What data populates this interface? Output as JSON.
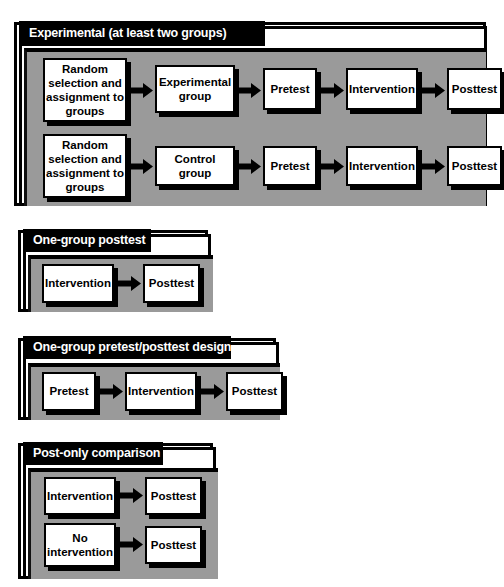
{
  "diagram": {
    "panel_color": "#9a9a9a",
    "title_bar_color": "#000000",
    "box_color": "#ffffff",
    "arrow_color": "#000000"
  },
  "sections": [
    {
      "id": "experimental",
      "title": "Experimental (at least two groups)",
      "rows": [
        {
          "id": "experimental-row-1",
          "nodes": [
            "Random selection and assignment to groups",
            "Experimental group",
            "Pretest",
            "Intervention",
            "Posttest"
          ]
        },
        {
          "id": "experimental-row-2",
          "nodes": [
            "Random selection and assignment to groups",
            "Control group",
            "Pretest",
            "Intervention",
            "Posttest"
          ]
        }
      ]
    },
    {
      "id": "one-group-posttest",
      "title": "One-group posttest",
      "rows": [
        {
          "id": "one-group-posttest-row-1",
          "nodes": [
            "Intervention",
            "Posttest"
          ]
        }
      ]
    },
    {
      "id": "one-group-pretest-posttest",
      "title": "One-group pretest/posttest design",
      "rows": [
        {
          "id": "one-group-pretest-posttest-row-1",
          "nodes": [
            "Pretest",
            "Intervention",
            "Posttest"
          ]
        }
      ]
    },
    {
      "id": "post-only-comparison",
      "title": "Post-only comparison",
      "rows": [
        {
          "id": "post-only-comparison-row-1",
          "nodes": [
            "Intervention",
            "Posttest"
          ]
        },
        {
          "id": "post-only-comparison-row-2",
          "nodes": [
            "No intervention",
            "Posttest"
          ]
        }
      ]
    }
  ]
}
